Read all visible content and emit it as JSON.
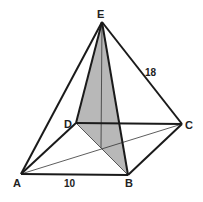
{
  "diagram": {
    "type": "square pyramid",
    "vertices": {
      "A": {
        "label": "A",
        "x": 21,
        "y": 174
      },
      "B": {
        "label": "B",
        "x": 128,
        "y": 175
      },
      "C": {
        "label": "C",
        "x": 182,
        "y": 124
      },
      "D": {
        "label": "D",
        "x": 76,
        "y": 123
      },
      "E": {
        "label": "E",
        "x": 102,
        "y": 22
      }
    },
    "center": {
      "x": 101,
      "y": 148
    },
    "labels": {
      "A": "A",
      "B": "B",
      "C": "C",
      "D": "D",
      "E": "E",
      "base_edge": "10",
      "lateral_edge": "18"
    },
    "shaded_region": "triangle EDB",
    "colors": {
      "stroke": "#1a1a1a",
      "shade": "#b8b8b8",
      "thin": "#333333"
    }
  }
}
